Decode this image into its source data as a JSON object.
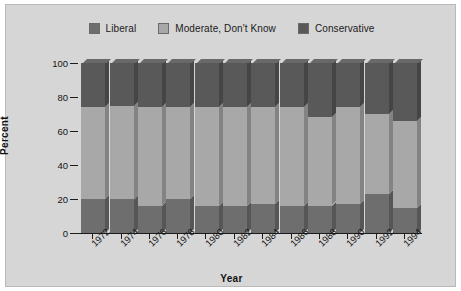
{
  "figure": {
    "background_color": "#d6d6d6",
    "border_color": "#b9b9b9"
  },
  "chart_data": {
    "type": "bar",
    "subtype": "stacked-percent-3d",
    "title": "",
    "xlabel": "Year",
    "ylabel": "Percent",
    "ylim": [
      0,
      100
    ],
    "yticks": [
      0,
      20,
      40,
      60,
      80,
      100
    ],
    "ytick_labels": [
      "0",
      "20",
      "40",
      "60",
      "80",
      "100"
    ],
    "grid": false,
    "legend_position": "top-center",
    "categories": [
      "1972",
      "1974",
      "1976",
      "1978",
      "1980",
      "1982",
      "1984",
      "1986",
      "1988",
      "1990",
      "1992",
      "1994"
    ],
    "series": [
      {
        "name": "Liberal",
        "color": "#6e6e6e",
        "values": [
          20,
          20,
          16,
          20,
          16,
          16,
          17,
          16,
          16,
          17,
          23,
          15
        ]
      },
      {
        "name": "Moderate, Don't Know",
        "color": "#a8a8a8",
        "values": [
          54,
          55,
          58,
          54,
          58,
          58,
          57,
          58,
          52,
          57,
          47,
          51
        ]
      },
      {
        "name": "Conservative",
        "color": "#595959",
        "values": [
          26,
          25,
          26,
          26,
          26,
          26,
          26,
          26,
          32,
          26,
          30,
          34
        ]
      }
    ],
    "stack_tops": {
      "liberal_top": [
        20,
        20,
        16,
        20,
        16,
        16,
        17,
        16,
        16,
        17,
        23,
        15
      ],
      "moderate_top": [
        74,
        75,
        74,
        74,
        74,
        74,
        74,
        74,
        68,
        74,
        70,
        66
      ]
    }
  },
  "legend": {
    "entries": [
      {
        "label": "Liberal",
        "color": "#6e6e6e"
      },
      {
        "label": "Moderate, Don't Know",
        "color": "#a8a8a8"
      },
      {
        "label": "Conservative",
        "color": "#595959"
      }
    ]
  }
}
